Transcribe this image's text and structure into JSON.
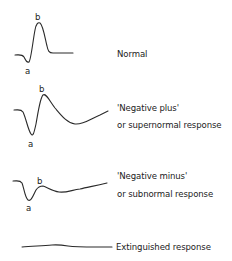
{
  "diagram": {
    "type": "electroretinogram-waveform-comparison",
    "waves": [
      {
        "id": "normal",
        "label_lines": [
          "Normal"
        ],
        "a_label": "a",
        "b_label": "b"
      },
      {
        "id": "negative-plus",
        "label_lines": [
          "'Negative plus'",
          "or supernormal response"
        ],
        "a_label": "a",
        "b_label": "b"
      },
      {
        "id": "negative-minus",
        "label_lines": [
          "'Negative minus'",
          "or subnormal response"
        ],
        "a_label": "a",
        "b_label": "b"
      },
      {
        "id": "extinguished",
        "label_lines": [
          "Extinguished response"
        ]
      }
    ],
    "colors": {
      "line": "#2a2a2a",
      "text": "#222222",
      "background": "#ffffff"
    }
  }
}
